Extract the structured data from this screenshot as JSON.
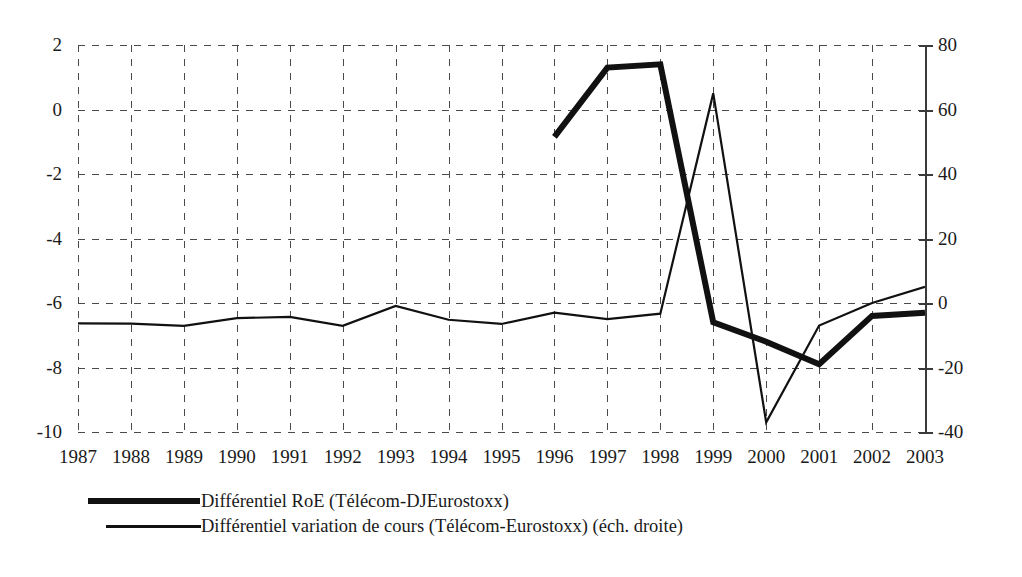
{
  "chart_data": {
    "type": "line",
    "title": "",
    "xlabel": "",
    "ylabel": "",
    "grid": true,
    "legend_position": "bottom-left",
    "categories": [
      "1987",
      "1988",
      "1989",
      "1990",
      "1991",
      "1992",
      "1993",
      "1994",
      "1995",
      "1996",
      "1997",
      "1998",
      "1999",
      "2000",
      "2001",
      "2002",
      "2003"
    ],
    "axes": {
      "left": {
        "label": "",
        "ylim": [
          -10,
          2
        ],
        "ticks": [
          2,
          0,
          -2,
          -4,
          -6,
          -8,
          -10
        ],
        "tick_labels": [
          "2",
          "0",
          "-2",
          "-4",
          "-6",
          "-8",
          "-10"
        ]
      },
      "right": {
        "label": "",
        "ylim": [
          -40,
          80
        ],
        "ticks": [
          80,
          60,
          40,
          20,
          0,
          -20,
          -40
        ],
        "tick_labels": [
          "80",
          "60",
          "40",
          "20",
          "0",
          "-20",
          "-40"
        ]
      }
    },
    "series": [
      {
        "name": "Différentiel RoE (Télécom-DJEurostoxx)",
        "axis": "left",
        "style": "thick",
        "color": "#111111",
        "x": [
          "1996",
          "1997",
          "1998",
          "1999",
          "2000",
          "2001",
          "2002",
          "2003"
        ],
        "values": [
          -0.85,
          1.3,
          1.4,
          -6.6,
          -7.2,
          -7.9,
          -6.4,
          -6.3
        ]
      },
      {
        "name": "Différentiel variation de cours (Télécom-Eurostoxx) (éch. droite)",
        "axis": "right",
        "style": "thin",
        "color": "#111111",
        "x": [
          "1987",
          "1988",
          "1989",
          "1990",
          "1991",
          "1992",
          "1993",
          "1994",
          "1995",
          "1996",
          "1997",
          "1998",
          "1999",
          "2000",
          "2001",
          "2002",
          "2003"
        ],
        "values": [
          -6.3,
          -6.4,
          -7.1,
          -4.7,
          -4.3,
          -7.1,
          -0.9,
          -5.2,
          -6.5,
          -3.0,
          -5.0,
          -3.3,
          65,
          -37,
          -7,
          0,
          5
        ]
      }
    ]
  },
  "legend": {
    "items": [
      {
        "label": "Différentiel RoE (Télécom-DJEurostoxx)",
        "style": "thick"
      },
      {
        "label": "Différentiel variation de cours (Télécom-Eurostoxx) (éch. droite)",
        "style": "thin"
      }
    ]
  },
  "colors": {
    "ink": "#111111",
    "grid": "#4a4a4a",
    "axis": "#3a3a3a",
    "background": "#ffffff"
  }
}
